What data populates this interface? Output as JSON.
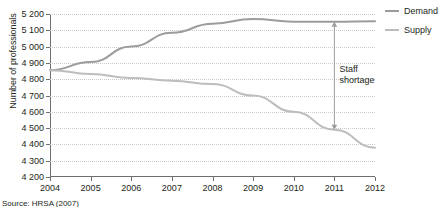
{
  "chart_data": {
    "type": "line",
    "title": "",
    "xlabel": "",
    "ylabel": "Number of professionals",
    "x": [
      2004,
      2005,
      2006,
      2007,
      2008,
      2009,
      2010,
      2011,
      2012
    ],
    "xticklabels": [
      "2004",
      "2005",
      "2006",
      "2007",
      "2008",
      "2009",
      "2010",
      "2011",
      "2012"
    ],
    "xlim": [
      2004,
      2012
    ],
    "ylim": [
      4200,
      5200
    ],
    "yticks": [
      4200,
      4300,
      4400,
      4500,
      4600,
      4700,
      4800,
      4900,
      5000,
      5100,
      5200
    ],
    "yticklabels": [
      "4 200",
      "4 300",
      "4 400",
      "4 500",
      "4 600",
      "4 700",
      "4 800",
      "4 900",
      "5 000",
      "5 100",
      "5 200"
    ],
    "grid": true,
    "legend_position": "right",
    "series": [
      {
        "name": "Demand",
        "color": "#9b9c9e",
        "values": [
          4855,
          4905,
          5000,
          5085,
          5140,
          5170,
          5152,
          5152,
          5155
        ]
      },
      {
        "name": "Supply",
        "color": "#bcbdbf",
        "values": [
          4855,
          4832,
          4808,
          4790,
          4770,
          4700,
          4600,
          4490,
          4380
        ]
      }
    ],
    "annotations": [
      {
        "name": "staff-shortage",
        "label": "Staff shortage",
        "label_line1": "Staff",
        "label_line2": "shortage",
        "x": 2011,
        "y_top": 5152,
        "y_bottom": 4490,
        "style": "double-headed-arrow",
        "color": "#9b9c9e"
      }
    ]
  },
  "legend": {
    "items": [
      {
        "label": "Demand",
        "color": "#9b9c9e"
      },
      {
        "label": "Supply",
        "color": "#bcbdbf"
      }
    ]
  },
  "source": {
    "text": "Source: HRSA (2007)"
  }
}
